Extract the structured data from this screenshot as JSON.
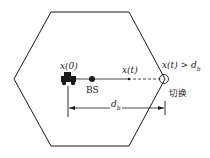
{
  "diagram": {
    "labels": {
      "start_position": "x(0)",
      "base_station": "BS",
      "current_position": "x(t)",
      "handover_condition": "x(t) > d",
      "handover_condition_sub": "b",
      "distance": "d",
      "distance_sub": "b",
      "handover": "切换"
    },
    "colors": {
      "stroke": "#1a1a1a",
      "background": "#ffffff"
    }
  }
}
